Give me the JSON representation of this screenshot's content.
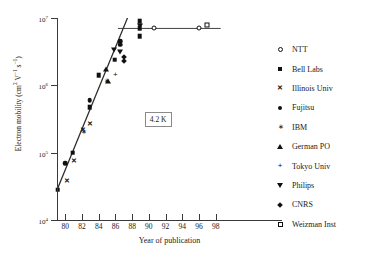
{
  "chart_data": {
    "type": "scatter",
    "title": "",
    "xlabel": "Year of publication",
    "ylabel_html": "Electron mobility (cm<sup>2</sup> V<sup>−1</sup> s<sup>−1</sup>)",
    "ylabel_plain": "Electron mobility (cm2 V-1 s-1)",
    "annotation": "4.2 K",
    "grid": false,
    "legend_position": "right",
    "xlim": [
      79,
      99
    ],
    "ylim_log10": [
      4,
      7
    ],
    "xticks": [
      80,
      82,
      84,
      86,
      88,
      90,
      92,
      94,
      96,
      98
    ],
    "xtick_labels": [
      "80",
      "82",
      "84",
      "86",
      "88",
      "90",
      "92",
      "94",
      "96",
      "98"
    ],
    "yticks_log10": [
      4,
      5,
      6,
      7
    ],
    "ytick_labels": [
      "10⁴",
      "10⁵",
      "10⁶",
      "10⁷"
    ],
    "ytick_mantissa": "10",
    "ytick_exponents": [
      "4",
      "5",
      "6",
      "7"
    ],
    "yscale": "log",
    "trend_line": {
      "x1": 79.0,
      "y1": 28000,
      "x2": 88.2,
      "y2": 17000000
    },
    "plateau_line": {
      "x1": 86.3,
      "y1": 7000000,
      "x2": 98.6,
      "y2": 7000000
    },
    "series": [
      {
        "name": "NTT",
        "marker": "circle-open",
        "points": [
          [
            90.6,
            7100000
          ],
          [
            96.0,
            7200000
          ]
        ]
      },
      {
        "name": "Bell Labs",
        "marker": "square-filled",
        "points": [
          [
            79.1,
            28000
          ],
          [
            80.9,
            100000
          ],
          [
            82.9,
            470000
          ],
          [
            84.0,
            1400000
          ],
          [
            85.9,
            2400000
          ],
          [
            88.9,
            9000000
          ],
          [
            88.9,
            7100000
          ],
          [
            88.9,
            5400000
          ]
        ]
      },
      {
        "name": "Illinois Univ",
        "marker": "x-cross",
        "points": [
          [
            80.2,
            38000
          ],
          [
            81.0,
            74000
          ],
          [
            82.1,
            215000
          ],
          [
            82.9,
            270000
          ]
        ]
      },
      {
        "name": "Fujitsu",
        "marker": "circle-filled",
        "points": [
          [
            80.0,
            70000
          ],
          [
            82.9,
            600000
          ],
          [
            86.6,
            4500000
          ],
          [
            86.6,
            4000000
          ]
        ]
      },
      {
        "name": "IBM",
        "marker": "asterisk",
        "points": [
          [
            82.2,
            205000
          ],
          [
            84.9,
            1150000
          ]
        ]
      },
      {
        "name": "German PO",
        "marker": "triangle-up",
        "points": [
          [
            84.9,
            1750000
          ],
          [
            85.1,
            1150000
          ]
        ]
      },
      {
        "name": "Tokyo Univ",
        "marker": "plus",
        "points": [
          [
            86.0,
            1400000
          ]
        ]
      },
      {
        "name": "Philips",
        "marker": "triangle-down",
        "points": [
          [
            85.8,
            3400000
          ],
          [
            86.5,
            3100000
          ],
          [
            88.9,
            7500000
          ]
        ]
      },
      {
        "name": "CNRS",
        "marker": "diamond",
        "points": [
          [
            86.8,
            2800000
          ],
          [
            86.8,
            2500000
          ]
        ]
      },
      {
        "name": "Weizman Inst",
        "marker": "square-open",
        "points": [
          [
            97.0,
            8000000
          ]
        ]
      }
    ],
    "legend_entries": [
      {
        "label": "NTT",
        "marker": "circle-open"
      },
      {
        "label": "Bell Labs",
        "marker": "square-filled"
      },
      {
        "label": "Illinois Univ",
        "marker": "x-cross"
      },
      {
        "label": "Fujitsu",
        "marker": "circle-filled"
      },
      {
        "label": "IBM",
        "marker": "asterisk"
      },
      {
        "label": "German PO",
        "marker": "triangle-up"
      },
      {
        "label": "Tokyo Univ",
        "marker": "plus"
      },
      {
        "label": "Philips",
        "marker": "triangle-down"
      },
      {
        "label": "CNRS",
        "marker": "diamond"
      },
      {
        "label": "Weizman Inst",
        "marker": "square-open"
      }
    ],
    "colors": {
      "ink": "#111111",
      "axis": "#3a3a3a",
      "line": "#2b2b2b",
      "background": "#ffffff"
    }
  }
}
